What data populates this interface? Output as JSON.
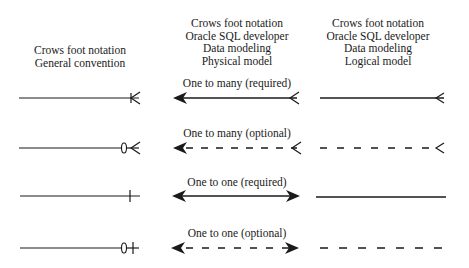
{
  "columns": [
    {
      "header": [
        "Crows foot notation",
        "General convention"
      ]
    },
    {
      "header": [
        "Crows foot notation",
        "Oracle SQL developer",
        "Data modeling",
        "Physical model"
      ]
    },
    {
      "header": [
        "Crows foot notation",
        "Oracle SQL developer",
        "Data modeling",
        "Logical model"
      ]
    }
  ],
  "rows": [
    {
      "label": "One to many (required)"
    },
    {
      "label": "One to many (optional)"
    },
    {
      "label": "One to one (required)"
    },
    {
      "label": "One to one (optional)"
    }
  ]
}
